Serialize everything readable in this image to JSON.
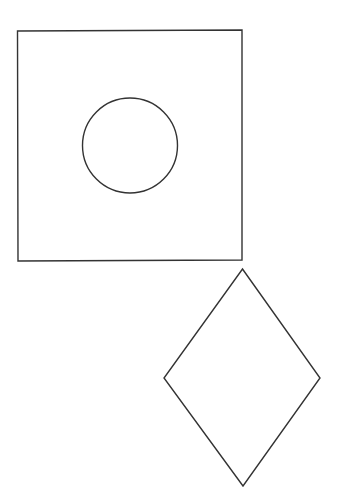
{
  "canvas": {
    "width": 342,
    "height": 504,
    "background": "#ffffff"
  },
  "stroke": {
    "color": "#333333",
    "width": 1.4
  },
  "shapes": {
    "square": {
      "points": "17.5,31 242,30 242,260 18,261"
    },
    "circle": {
      "cx": 130,
      "cy": 145.5,
      "r": 47.5
    },
    "diamond": {
      "points": "242.5,269 320,378 243,486 164,378"
    }
  }
}
